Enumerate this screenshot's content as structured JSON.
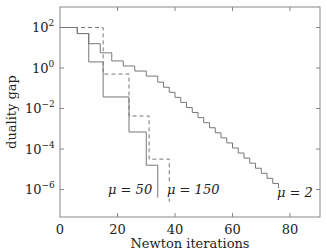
{
  "chart_data": {
    "type": "line",
    "title": "",
    "xlabel": "Newton iterations",
    "ylabel": "duality gap",
    "xlim": [
      0,
      90
    ],
    "ylim_log10": [
      -7.3,
      3.0
    ],
    "yscale": "log",
    "grid": false,
    "legend": "none (inline annotations)",
    "xticks": [
      0,
      20,
      40,
      60,
      80
    ],
    "yticks": [
      "10^2",
      "10^0",
      "10^-2",
      "10^-4",
      "10^-6"
    ],
    "series": [
      {
        "name": "μ = 2",
        "style": "solid",
        "log10_steps": [
          [
            0,
            2.0
          ],
          [
            6,
            1.7
          ],
          [
            10,
            1.2
          ],
          [
            14,
            0.75
          ],
          [
            18,
            0.35
          ],
          [
            22,
            0.1
          ],
          [
            26,
            -0.15
          ],
          [
            30,
            -0.4
          ],
          [
            34,
            -0.7
          ],
          [
            36,
            -0.95
          ],
          [
            38,
            -1.2
          ],
          [
            40,
            -1.45
          ],
          [
            42,
            -1.7
          ],
          [
            44,
            -1.95
          ],
          [
            46,
            -2.2
          ],
          [
            48,
            -2.45
          ],
          [
            50,
            -2.7
          ],
          [
            52,
            -2.95
          ],
          [
            54,
            -3.2
          ],
          [
            56,
            -3.45
          ],
          [
            58,
            -3.7
          ],
          [
            60,
            -3.95
          ],
          [
            62,
            -4.2
          ],
          [
            64,
            -4.45
          ],
          [
            66,
            -4.7
          ],
          [
            68,
            -4.95
          ],
          [
            70,
            -5.2
          ],
          [
            72,
            -5.45
          ],
          [
            74,
            -5.7
          ],
          [
            76,
            -5.95
          ],
          [
            82,
            -6.1
          ]
        ]
      },
      {
        "name": "μ = 50",
        "style": "solid",
        "log10_steps": [
          [
            0,
            2.0
          ],
          [
            6,
            1.7
          ],
          [
            10,
            0.3
          ],
          [
            15,
            -1.43
          ],
          [
            24,
            -3.16
          ],
          [
            30,
            -4.8
          ],
          [
            34,
            -6.4
          ]
        ]
      },
      {
        "name": "μ = 150",
        "style": "dashed",
        "log10_steps": [
          [
            0,
            2.0
          ],
          [
            15,
            -0.3
          ],
          [
            24,
            -2.37
          ],
          [
            31,
            -4.5
          ],
          [
            38,
            -6.6
          ]
        ]
      }
    ],
    "annotations": [
      {
        "text": "μ = 50",
        "x": 24,
        "log10_y": -6.5
      },
      {
        "text": "μ = 150",
        "x": 40,
        "log10_y": -6.5
      },
      {
        "text": "μ = 2",
        "x": 82,
        "log10_y": -6.5
      }
    ]
  },
  "labels": {
    "xlabel": "Newton iterations",
    "ylabel": "duality gap",
    "xticks": [
      "0",
      "20",
      "40",
      "60",
      "80"
    ],
    "ann_mu50": "μ = 50",
    "ann_mu150": "μ = 150",
    "ann_mu2": "μ = 2"
  }
}
